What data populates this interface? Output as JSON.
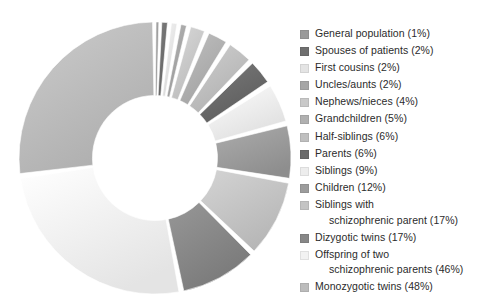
{
  "chart_data": {
    "type": "pie",
    "variant": "doughnut",
    "title": "",
    "subtitle": "",
    "xlabel": "",
    "ylabel": "",
    "legend_position": "right",
    "grid": false,
    "value_suffix": "%",
    "start_angle_deg": 0,
    "direction": "clockwise",
    "inner_radius_ratio": 0.46,
    "categories": [
      "General population",
      "Spouses of patients",
      "First cousins",
      "Uncles/aunts",
      "Nephews/nieces",
      "Grandchildren",
      "Half-siblings",
      "Parents",
      "Siblings",
      "Children",
      "Siblings with schizophrenic parent",
      "Dizygotic twins",
      "Offspring of two schizophrenic parents",
      "Monozygotic twins"
    ],
    "values": [
      1,
      2,
      2,
      2,
      4,
      5,
      6,
      6,
      9,
      12,
      17,
      17,
      46,
      48
    ],
    "total": 177,
    "colors": [
      "#9a9a9a",
      "#6f6f6f",
      "#e4e4e4",
      "#a6a6a6",
      "#c9c9c9",
      "#b0b0b0",
      "#bfbfbf",
      "#6a6a6a",
      "#ededed",
      "#9c9c9c",
      "#c4c4c4",
      "#878787",
      "#f2f2f2",
      "#bcbcbc"
    ]
  },
  "legend": {
    "items": [
      {
        "label": "General population (1%)",
        "line1": "General population (1%)",
        "line2": "",
        "color": "#9a9a9a"
      },
      {
        "label": "Spouses of patients (2%)",
        "line1": "Spouses of patients (2%)",
        "line2": "",
        "color": "#6f6f6f"
      },
      {
        "label": "First cousins (2%)",
        "line1": "First cousins (2%)",
        "line2": "",
        "color": "#e4e4e4"
      },
      {
        "label": "Uncles/aunts (2%)",
        "line1": "Uncles/aunts (2%)",
        "line2": "",
        "color": "#a6a6a6"
      },
      {
        "label": "Nephews/nieces (4%)",
        "line1": "Nephews/nieces (4%)",
        "line2": "",
        "color": "#c9c9c9"
      },
      {
        "label": "Grandchildren (5%)",
        "line1": "Grandchildren (5%)",
        "line2": "",
        "color": "#b0b0b0"
      },
      {
        "label": "Half-siblings (6%)",
        "line1": "Half-siblings (6%)",
        "line2": "",
        "color": "#bfbfbf"
      },
      {
        "label": "Parents (6%)",
        "line1": "Parents (6%)",
        "line2": "",
        "color": "#6a6a6a"
      },
      {
        "label": "Siblings (9%)",
        "line1": "Siblings (9%)",
        "line2": "",
        "color": "#ededed"
      },
      {
        "label": "Children (12%)",
        "line1": "Children (12%)",
        "line2": "",
        "color": "#9c9c9c"
      },
      {
        "label": "Siblings with schizophrenic parent (17%)",
        "line1": "Siblings with",
        "line2": "schizophrenic parent (17%)",
        "color": "#c4c4c4"
      },
      {
        "label": "Dizygotic twins (17%)",
        "line1": "Dizygotic twins (17%)",
        "line2": "",
        "color": "#878787"
      },
      {
        "label": "Offspring of two schizophrenic parents (46%)",
        "line1": "Offspring of two",
        "line2": "schizophrenic parents (46%)",
        "color": "#f2f2f2"
      },
      {
        "label": "Monozygotic twins (48%)",
        "line1": "Monozygotic twins (48%)",
        "line2": "",
        "color": "#bcbcbc"
      }
    ]
  }
}
